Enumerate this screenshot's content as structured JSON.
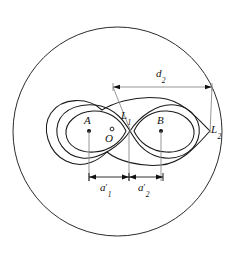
{
  "figure": {
    "background_color": "#ffffff",
    "stroke_color": "#1a1a1a",
    "dimension_color": "#8a8a8a",
    "width": 235,
    "height": 265
  },
  "labels": {
    "focus_left": "A",
    "focus_right": "B",
    "center": "O",
    "lagrange_inner": "L",
    "lagrange_inner_sub": "1",
    "lagrange_outer": "L",
    "lagrange_outer_sub": "2",
    "distance_d": "d",
    "distance_d_sub": "2",
    "segment_a1": "a",
    "segment_a1_prime": "′",
    "segment_a1_sub": "1",
    "segment_a2": "a",
    "segment_a2_prime": "′",
    "segment_a2_sub": "2"
  },
  "geometry": {
    "outer_circle": {
      "cx": 117.5,
      "cy": 131.5,
      "r": 104.5
    },
    "focus_left_point": {
      "x": 89,
      "y": 131
    },
    "focus_right_point": {
      "x": 161,
      "y": 131
    },
    "center_point": {
      "x": 112,
      "y": 131
    },
    "lagrange_inner_point": {
      "x": 130,
      "y": 131
    },
    "lagrange_outer_point": {
      "x": 210,
      "y": 131
    },
    "axis_y": 131
  },
  "dimensions": {
    "d2": {
      "label": "d₂",
      "y": 87,
      "x_start": 113,
      "x_end": 212,
      "leader_from": {
        "x": 130,
        "y": 131
      },
      "leader_to": {
        "x": 210,
        "y": 131
      }
    },
    "a1": {
      "label": "a′₁",
      "y": 177,
      "x_start": 89,
      "x_end": 129
    },
    "a2": {
      "label": "a′₂",
      "y": 177,
      "x_start": 129,
      "x_end": 163
    }
  },
  "curves": {
    "outer_circle_name": "bounding-circle",
    "inner_lemniscate_name": "inner-equipotential",
    "outer_lemniscate_name": "outer-equipotential",
    "small_oval_left_name": "inner-oval-left",
    "small_oval_right_name": "inner-oval-right"
  }
}
